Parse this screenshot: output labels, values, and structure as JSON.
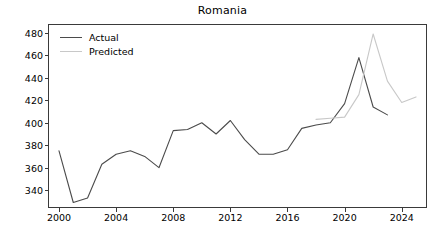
{
  "chart_data": {
    "type": "line",
    "title": "Romania",
    "xlabel": "",
    "ylabel": "",
    "xlim": [
      1999.3,
      2025.7
    ],
    "ylim": [
      325.0,
      487.0
    ],
    "grid": false,
    "legend_position": "upper left",
    "xticks": [
      2000,
      2004,
      2008,
      2012,
      2016,
      2020,
      2024
    ],
    "yticks": [
      340,
      360,
      380,
      400,
      420,
      440,
      460,
      480
    ],
    "series": [
      {
        "name": "Actual",
        "color": "#4b4b4b",
        "x": [
          2000,
          2001,
          2002,
          2003,
          2004,
          2005,
          2006,
          2007,
          2008,
          2009,
          2010,
          2011,
          2012,
          2013,
          2014,
          2015,
          2016,
          2017,
          2018,
          2019,
          2020,
          2021,
          2022,
          2023
        ],
        "values": [
          375,
          329,
          333,
          363,
          372,
          375,
          370,
          360,
          393,
          394,
          400,
          390,
          402,
          385,
          372,
          372,
          376,
          395,
          398,
          400,
          417,
          458,
          414,
          407
        ]
      },
      {
        "name": "Predicted",
        "color": "#c8c8c8",
        "x": [
          2018,
          2019,
          2020,
          2021,
          2022,
          2023,
          2024,
          2025
        ],
        "values": [
          403,
          404,
          405,
          425,
          479,
          437,
          418,
          423
        ]
      }
    ]
  }
}
